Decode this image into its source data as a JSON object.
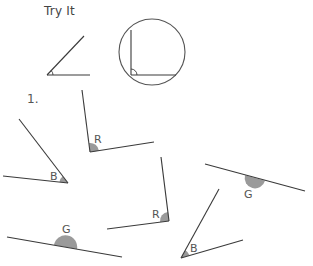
{
  "header": {
    "title": "Try It"
  },
  "problem": {
    "number": "1."
  },
  "colors": {
    "line": "#3a3a3a",
    "fill": "#9a9a9a",
    "text": "#555555"
  },
  "examples": [
    {
      "type": "acute-angle",
      "description": "example acute angle with small arc at vertex"
    },
    {
      "type": "right-angle-in-circle",
      "description": "example right angle inside a circle with arc at vertex"
    }
  ],
  "angles": [
    {
      "label": "B",
      "position": "left-middle",
      "kind": "acute"
    },
    {
      "label": "R",
      "position": "top-center",
      "kind": "right"
    },
    {
      "label": "R",
      "position": "center",
      "kind": "right"
    },
    {
      "label": "G",
      "position": "right",
      "kind": "straight"
    },
    {
      "label": "G",
      "position": "bottom-left",
      "kind": "straight"
    },
    {
      "label": "B",
      "position": "bottom-center",
      "kind": "acute"
    }
  ]
}
